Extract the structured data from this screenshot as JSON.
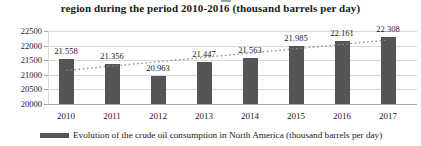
{
  "chart_data": {
    "type": "bar",
    "title": "region during the period 2010-2016 (thousand barrels per day)",
    "categories": [
      "2010",
      "2011",
      "2012",
      "2013",
      "2014",
      "2015",
      "2016",
      "2017"
    ],
    "values": [
      21558,
      21356,
      20963,
      21447,
      21563,
      21985,
      22161,
      22308
    ],
    "bar_labels": [
      "21.558",
      "21.356",
      "20.963",
      "21.447",
      "21.563",
      "21.985",
      "22.161",
      "22.308"
    ],
    "ylim": [
      20000,
      22500
    ],
    "ytick_interval": 500,
    "ytick_labels": [
      "22500",
      "22000",
      "21500",
      "21000",
      "20500",
      "20000"
    ],
    "grid": true,
    "legend_position": "bottom",
    "legend": "Evolution of the crude oil consumption in North America (thousand barrels per day)",
    "trendline": {
      "style": "dotted",
      "start_value": 21150,
      "end_value": 22190
    },
    "colors": {
      "bar": "#555555",
      "trendline": "#8c8c8c",
      "gridline": "#d9d9d9",
      "axis": "#a6a6a6",
      "text": "#1a1a1a",
      "background": "#ffffff"
    }
  }
}
